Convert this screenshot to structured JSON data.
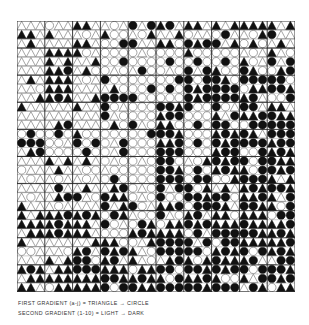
{
  "figure": {
    "grid": {
      "columns": 30,
      "rows": 30,
      "block_size": 3,
      "ink_color": "#111111",
      "paper_color": "#ffffff",
      "line_color": "#666666",
      "blocks": {
        "description": "10x10 major blocks; each value pair = [circle_ratio 0..1, darkness 0..1]",
        "rows": [
          [
            [
              0.15,
              0.2
            ],
            [
              0.2,
              0.25
            ],
            [
              0.2,
              0.25
            ],
            [
              0.5,
              0.35
            ],
            [
              0.5,
              0.55
            ],
            [
              0.2,
              0.5
            ],
            [
              0.35,
              0.55
            ],
            [
              0.3,
              0.5
            ],
            [
              0.3,
              0.45
            ],
            [
              0.2,
              0.5
            ]
          ],
          [
            [
              0.15,
              0.2
            ],
            [
              0.05,
              0.85
            ],
            [
              0.2,
              0.2
            ],
            [
              0.85,
              0.2
            ],
            [
              0.85,
              0.2
            ],
            [
              0.9,
              0.15
            ],
            [
              0.9,
              0.25
            ],
            [
              0.8,
              0.45
            ],
            [
              0.55,
              0.55
            ],
            [
              0.45,
              0.55
            ]
          ],
          [
            [
              0.15,
              0.2
            ],
            [
              0.05,
              0.85
            ],
            [
              0.15,
              0.2
            ],
            [
              0.85,
              0.35
            ],
            [
              0.9,
              0.15
            ],
            [
              0.9,
              0.1
            ],
            [
              0.9,
              0.85
            ],
            [
              0.75,
              0.8
            ],
            [
              0.7,
              0.8
            ],
            [
              0.65,
              0.75
            ]
          ],
          [
            [
              0.1,
              0.15
            ],
            [
              0.1,
              0.2
            ],
            [
              0.15,
              0.2
            ],
            [
              0.85,
              0.25
            ],
            [
              0.95,
              0.15
            ],
            [
              0.7,
              0.85
            ],
            [
              0.9,
              0.25
            ],
            [
              0.6,
              0.75
            ],
            [
              0.55,
              0.8
            ],
            [
              0.55,
              0.75
            ]
          ],
          [
            [
              0.85,
              0.35
            ],
            [
              0.85,
              0.45
            ],
            [
              0.85,
              0.35
            ],
            [
              0.9,
              0.2
            ],
            [
              0.95,
              0.15
            ],
            [
              0.7,
              0.8
            ],
            [
              0.9,
              0.2
            ],
            [
              0.65,
              0.75
            ],
            [
              0.6,
              0.75
            ],
            [
              0.6,
              0.8
            ]
          ],
          [
            [
              0.2,
              0.2
            ],
            [
              0.2,
              0.2
            ],
            [
              0.25,
              0.2
            ],
            [
              0.8,
              0.2
            ],
            [
              0.9,
              0.15
            ],
            [
              0.6,
              0.85
            ],
            [
              0.85,
              0.3
            ],
            [
              0.55,
              0.7
            ],
            [
              0.6,
              0.75
            ],
            [
              0.55,
              0.8
            ]
          ],
          [
            [
              0.15,
              0.15
            ],
            [
              0.2,
              0.2
            ],
            [
              0.15,
              0.2
            ],
            [
              0.5,
              0.85
            ],
            [
              0.85,
              0.2
            ],
            [
              0.55,
              0.5
            ],
            [
              0.5,
              0.55
            ],
            [
              0.55,
              0.75
            ],
            [
              0.6,
              0.8
            ],
            [
              0.55,
              0.8
            ]
          ],
          [
            [
              0.15,
              0.85
            ],
            [
              0.3,
              0.85
            ],
            [
              0.3,
              0.8
            ],
            [
              0.8,
              0.25
            ],
            [
              0.55,
              0.55
            ],
            [
              0.55,
              0.85
            ],
            [
              0.5,
              0.7
            ],
            [
              0.55,
              0.8
            ],
            [
              0.6,
              0.85
            ],
            [
              0.55,
              0.8
            ]
          ],
          [
            [
              0.3,
              0.25
            ],
            [
              0.3,
              0.3
            ],
            [
              0.35,
              0.3
            ],
            [
              0.55,
              0.75
            ],
            [
              0.6,
              0.6
            ],
            [
              0.55,
              0.85
            ],
            [
              0.5,
              0.6
            ],
            [
              0.55,
              0.8
            ],
            [
              0.6,
              0.8
            ],
            [
              0.55,
              0.85
            ]
          ],
          [
            [
              0.15,
              0.85
            ],
            [
              0.2,
              0.85
            ],
            [
              0.25,
              0.85
            ],
            [
              0.55,
              0.85
            ],
            [
              0.5,
              0.8
            ],
            [
              0.5,
              0.85
            ],
            [
              0.55,
              0.85
            ],
            [
              0.6,
              0.85
            ],
            [
              0.6,
              0.8
            ],
            [
              0.55,
              0.85
            ]
          ]
        ]
      }
    },
    "caption_line_1": "FIRST GRADIENT (a-j) = TRIANGLE → CIRCLE",
    "caption_line_2": "SECOND GRADIENT (1-10) = LIGHT → DARK"
  }
}
